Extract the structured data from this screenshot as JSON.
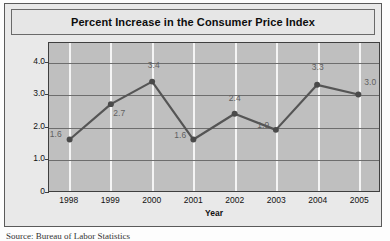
{
  "figure": {
    "title": "Percent Increase in the Consumer Price Index",
    "source": "Source: Bureau of Labor Statistics"
  },
  "colors": {
    "line": "#555555",
    "marker": "#4a4a4a",
    "plot_background": "#bfbfbf",
    "figure_background": "#e9e9e9",
    "grid_vertical": "#f4f4f4",
    "grid_horizontal": "#6d6d6d",
    "data_label": "#5f5f5f"
  },
  "chart_data": {
    "type": "line",
    "title": "Percent Increase in the Consumer Price Index",
    "xlabel": "Year",
    "ylabel": "Percent Increase",
    "categories": [
      "1998",
      "1999",
      "2000",
      "2001",
      "2002",
      "2003",
      "2004",
      "2005"
    ],
    "values": [
      1.6,
      2.7,
      3.4,
      1.6,
      2.4,
      1.9,
      3.3,
      3.0
    ],
    "data_labels": [
      "1.6",
      "2.7",
      "3.4",
      "1.6",
      "2.4",
      "1.9",
      "3.3",
      "3.0"
    ],
    "ylim": [
      0,
      4.6
    ],
    "ytick_values": [
      0,
      1.0,
      2.0,
      3.0,
      4.0
    ],
    "ytick_labels": [
      "0",
      "1.0",
      "2.0",
      "3.0",
      "4.0"
    ],
    "grid": {
      "vertical": true,
      "horizontal": true
    },
    "legend": null,
    "markers": true
  }
}
